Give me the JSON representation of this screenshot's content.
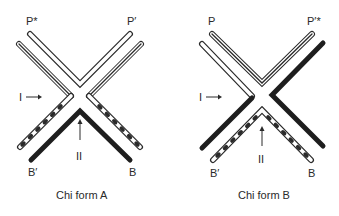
{
  "figure": {
    "panels": [
      {
        "caption": "Chi form A",
        "labels": {
          "top_left": "P*",
          "top_right": "P′",
          "bottom_left": "B′",
          "bottom_right": "B",
          "arrow_left": "I",
          "arrow_bottom": "II"
        },
        "strands": {
          "top_v": "open double-line strand (P* to P′)",
          "upper_left_arm": "triple-line strand",
          "upper_right_arm": "triple-line strand",
          "lower_left_arm": "dashed open strand with X marks",
          "lower_right_arm": "dashed open strand with X marks",
          "bottom_chevron": "solid black strand (B′ to B)"
        }
      },
      {
        "caption": "Chi form B",
        "labels": {
          "top_left": "P",
          "top_right": "P′*",
          "bottom_left": "B′",
          "bottom_right": "B",
          "arrow_left": "I",
          "arrow_bottom": "II"
        },
        "strands": {
          "top_v": "triple-line strand (P to P′*)",
          "upper_left_arm": "open double-line strand",
          "upper_right_arm": "solid black strand",
          "lower_left_arm": "solid black strand",
          "bottom_chevron": "dashed open strand with X marks (B′ to B)"
        }
      }
    ],
    "colors": {
      "ink": "#2a2a2a",
      "background": "#ffffff"
    }
  }
}
